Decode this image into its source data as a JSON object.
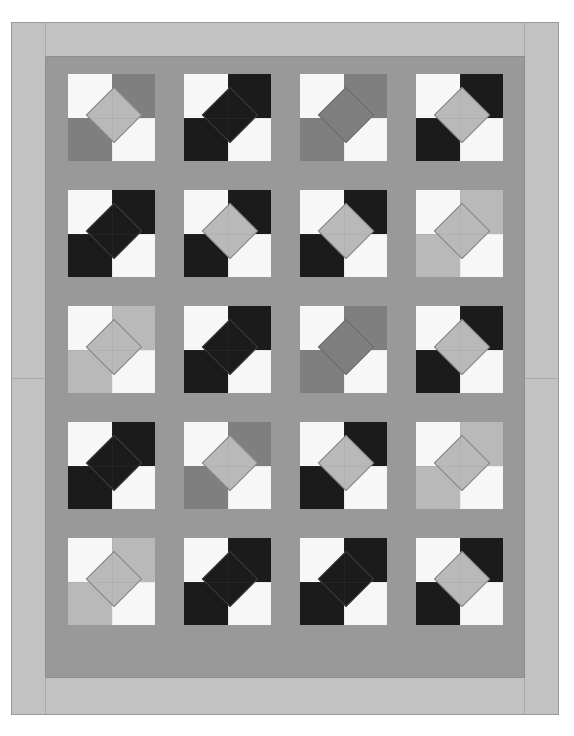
{
  "artwork": {
    "title": "Square-in-a-Square Quilt Top",
    "kind": "quilt-pattern",
    "canvas": {
      "width": 574,
      "height": 736,
      "background": "#ffffff"
    }
  },
  "palette": {
    "white": "#f7f7f7",
    "light_gray": "#b9b9b9",
    "medium_gray": "#7f7f7f",
    "black": "#1b1b1b",
    "sashing": "#999999",
    "inner_border": "#999999",
    "outer_border": "#c2c2c2",
    "seam_line": "#6e6e6e"
  },
  "layout": {
    "rows": 5,
    "columns": 4,
    "block_size": 87,
    "sashing_width": 29,
    "field": {
      "left": 68,
      "top": 74,
      "width": 436,
      "height": 583
    },
    "outer_border": {
      "left": 11,
      "top": 22,
      "width": 548,
      "height": 693,
      "thickness": 34
    },
    "inner_border": {
      "left": 45,
      "top": 56,
      "width": 480,
      "height": 622,
      "thickness": 23
    }
  },
  "blocks": [
    {
      "row": 1,
      "col": 1,
      "center": "#b9b9b9",
      "tl": "#f7f7f7",
      "tr": "#7f7f7f",
      "bl": "#7f7f7f",
      "br": "#f7f7f7"
    },
    {
      "row": 1,
      "col": 2,
      "center": "#1b1b1b",
      "tl": "#f7f7f7",
      "tr": "#1b1b1b",
      "bl": "#1b1b1b",
      "br": "#f7f7f7"
    },
    {
      "row": 1,
      "col": 3,
      "center": "#7f7f7f",
      "tl": "#f7f7f7",
      "tr": "#7f7f7f",
      "bl": "#7f7f7f",
      "br": "#f7f7f7"
    },
    {
      "row": 1,
      "col": 4,
      "center": "#b9b9b9",
      "tl": "#f7f7f7",
      "tr": "#1b1b1b",
      "bl": "#1b1b1b",
      "br": "#f7f7f7"
    },
    {
      "row": 2,
      "col": 1,
      "center": "#1b1b1b",
      "tl": "#f7f7f7",
      "tr": "#1b1b1b",
      "bl": "#1b1b1b",
      "br": "#f7f7f7"
    },
    {
      "row": 2,
      "col": 2,
      "center": "#b9b9b9",
      "tl": "#f7f7f7",
      "tr": "#1b1b1b",
      "bl": "#1b1b1b",
      "br": "#f7f7f7"
    },
    {
      "row": 2,
      "col": 3,
      "center": "#b9b9b9",
      "tl": "#f7f7f7",
      "tr": "#1b1b1b",
      "bl": "#1b1b1b",
      "br": "#f7f7f7"
    },
    {
      "row": 2,
      "col": 4,
      "center": "#b9b9b9",
      "tl": "#f7f7f7",
      "tr": "#b9b9b9",
      "bl": "#b9b9b9",
      "br": "#f7f7f7"
    },
    {
      "row": 3,
      "col": 1,
      "center": "#b9b9b9",
      "tl": "#f7f7f7",
      "tr": "#b9b9b9",
      "bl": "#b9b9b9",
      "br": "#f7f7f7"
    },
    {
      "row": 3,
      "col": 2,
      "center": "#1b1b1b",
      "tl": "#f7f7f7",
      "tr": "#1b1b1b",
      "bl": "#1b1b1b",
      "br": "#f7f7f7"
    },
    {
      "row": 3,
      "col": 3,
      "center": "#7f7f7f",
      "tl": "#f7f7f7",
      "tr": "#7f7f7f",
      "bl": "#7f7f7f",
      "br": "#f7f7f7"
    },
    {
      "row": 3,
      "col": 4,
      "center": "#b9b9b9",
      "tl": "#f7f7f7",
      "tr": "#1b1b1b",
      "bl": "#1b1b1b",
      "br": "#f7f7f7"
    },
    {
      "row": 4,
      "col": 1,
      "center": "#1b1b1b",
      "tl": "#f7f7f7",
      "tr": "#1b1b1b",
      "bl": "#1b1b1b",
      "br": "#f7f7f7"
    },
    {
      "row": 4,
      "col": 2,
      "center": "#b9b9b9",
      "tl": "#f7f7f7",
      "tr": "#7f7f7f",
      "bl": "#7f7f7f",
      "br": "#f7f7f7"
    },
    {
      "row": 4,
      "col": 3,
      "center": "#b9b9b9",
      "tl": "#f7f7f7",
      "tr": "#1b1b1b",
      "bl": "#1b1b1b",
      "br": "#f7f7f7"
    },
    {
      "row": 4,
      "col": 4,
      "center": "#b9b9b9",
      "tl": "#f7f7f7",
      "tr": "#b9b9b9",
      "bl": "#b9b9b9",
      "br": "#f7f7f7"
    },
    {
      "row": 5,
      "col": 1,
      "center": "#b9b9b9",
      "tl": "#f7f7f7",
      "tr": "#b9b9b9",
      "bl": "#b9b9b9",
      "br": "#f7f7f7"
    },
    {
      "row": 5,
      "col": 2,
      "center": "#1b1b1b",
      "tl": "#f7f7f7",
      "tr": "#1b1b1b",
      "bl": "#1b1b1b",
      "br": "#f7f7f7"
    },
    {
      "row": 5,
      "col": 3,
      "center": "#1b1b1b",
      "tl": "#f7f7f7",
      "tr": "#1b1b1b",
      "bl": "#1b1b1b",
      "br": "#f7f7f7"
    },
    {
      "row": 5,
      "col": 4,
      "center": "#b9b9b9",
      "tl": "#f7f7f7",
      "tr": "#1b1b1b",
      "bl": "#1b1b1b",
      "br": "#f7f7f7"
    }
  ]
}
